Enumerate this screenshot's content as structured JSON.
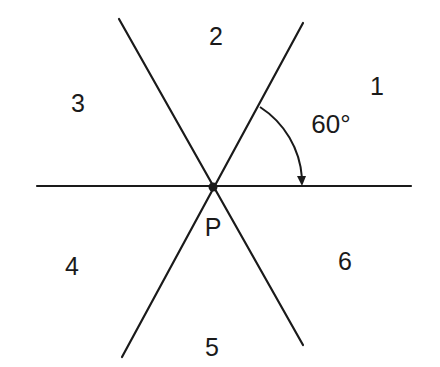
{
  "diagram": {
    "type": "intersecting-lines",
    "center_point": {
      "label": "P",
      "x": 213,
      "y": 187
    },
    "angle": {
      "label": "60°",
      "value_deg": 60
    },
    "regions": [
      {
        "id": 1,
        "label": "1",
        "x": 377,
        "y": 86
      },
      {
        "id": 2,
        "label": "2",
        "x": 216,
        "y": 36
      },
      {
        "id": 3,
        "label": "3",
        "x": 78,
        "y": 103
      },
      {
        "id": 4,
        "label": "4",
        "x": 72,
        "y": 266
      },
      {
        "id": 5,
        "label": "5",
        "x": 212,
        "y": 347
      },
      {
        "id": 6,
        "label": "6",
        "x": 345,
        "y": 261
      }
    ],
    "lines": [
      {
        "name": "horizontal-line",
        "x1": 37,
        "y1": 186,
        "x2": 411,
        "y2": 186
      },
      {
        "name": "line-60deg",
        "x1": 122,
        "y1": 357,
        "x2": 303,
        "y2": 23
      },
      {
        "name": "line-120deg",
        "x1": 119,
        "y1": 19,
        "x2": 303,
        "y2": 345
      }
    ],
    "colors": {
      "stroke": "#1a1a1a",
      "background": "#ffffff"
    }
  }
}
